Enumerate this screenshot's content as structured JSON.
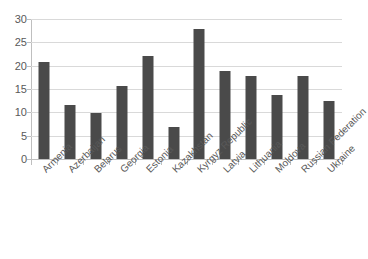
{
  "chart_data": {
    "type": "bar",
    "title": "",
    "subtitle": "",
    "xlabel": "",
    "ylabel": "",
    "categories": [
      "Armenia",
      "Azerbaijan",
      "Belarus",
      "Georgia",
      "Estonia",
      "Kazakhstan",
      "Kyrgyz Republic",
      "Latvia",
      "Lithuania",
      "Moldova",
      "Russian Federation",
      "Ukraine"
    ],
    "values": [
      20.8,
      11.6,
      9.9,
      15.7,
      22.0,
      6.8,
      27.9,
      18.9,
      17.8,
      13.7,
      17.8,
      12.5
    ],
    "ylim": [
      0,
      30
    ],
    "ytick_values": [
      0,
      5,
      10,
      15,
      20,
      25,
      30
    ],
    "ytick_labels": [
      "0",
      "5",
      "10",
      "15",
      "20",
      "25",
      "30"
    ],
    "grid": "horizontal",
    "legend": "none",
    "series": [
      {
        "name": "",
        "values": [
          20.8,
          11.6,
          9.9,
          15.7,
          22.0,
          6.8,
          27.9,
          18.9,
          17.8,
          13.7,
          17.8,
          12.5
        ]
      }
    ],
    "colors": {
      "bar": "#4a4a4a",
      "gridline": "#d9d9d9",
      "axis": "#bfbfbf",
      "text": "#595959",
      "background": "#ffffff"
    },
    "xlabel_rotation": -45
  }
}
